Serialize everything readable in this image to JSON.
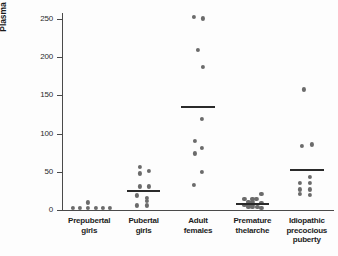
{
  "chart_data": {
    "type": "scatter",
    "title": "",
    "xlabel": "",
    "ylabel": "Plasma E2 (pg/mL)",
    "ylabel_parts": {
      "prefix": "Plasma E",
      "sub": "2",
      "suffix": " (pg/mL)"
    },
    "ylim": [
      0,
      258
    ],
    "yticks": [
      0,
      50,
      100,
      150,
      200,
      250
    ],
    "ytick_labels": [
      "0",
      "50",
      "100",
      "150",
      "200",
      "250"
    ],
    "grid": false,
    "legend": "none",
    "categories": [
      "Prepubertal girls",
      "Pubertal girls",
      "Adult females",
      "Premature thelarche",
      "Idiopathic precocious puberty"
    ],
    "category_label_lines": [
      [
        "Prepubertal",
        "girls"
      ],
      [
        "Pubertal",
        "girls"
      ],
      [
        "Adult",
        "females"
      ],
      [
        "Premature",
        "thelarche"
      ],
      [
        "Idiopathic",
        "precocious",
        "puberty"
      ]
    ],
    "series": [
      {
        "name": "Prepubertal girls",
        "mean": 3,
        "mean_line": false,
        "points": [
          {
            "value": 3,
            "offset": -16
          },
          {
            "value": 3,
            "offset": -9
          },
          {
            "value": 10,
            "offset": -1
          },
          {
            "value": 3,
            "offset": -1
          },
          {
            "value": 3,
            "offset": 7
          },
          {
            "value": 3,
            "offset": 14
          },
          {
            "value": 3,
            "offset": 21
          }
        ]
      },
      {
        "name": "Pubertal girls",
        "mean": 25,
        "mean_line": true,
        "points": [
          {
            "value": 56,
            "offset": -4
          },
          {
            "value": 48,
            "offset": -4
          },
          {
            "value": 51,
            "offset": 5
          },
          {
            "value": 31,
            "offset": -4
          },
          {
            "value": 31,
            "offset": 5
          },
          {
            "value": 19,
            "offset": -7
          },
          {
            "value": 16,
            "offset": 3
          },
          {
            "value": 12,
            "offset": 3
          },
          {
            "value": 6,
            "offset": -7
          },
          {
            "value": 6,
            "offset": 3
          }
        ]
      },
      {
        "name": "Adult females",
        "mean": 135,
        "mean_line": true,
        "points": [
          {
            "value": 253,
            "offset": -4
          },
          {
            "value": 251,
            "offset": 5
          },
          {
            "value": 210,
            "offset": 0
          },
          {
            "value": 187,
            "offset": 5
          },
          {
            "value": 119,
            "offset": 4
          },
          {
            "value": 90,
            "offset": -3
          },
          {
            "value": 81,
            "offset": 4
          },
          {
            "value": 74,
            "offset": -3
          },
          {
            "value": 50,
            "offset": 4
          },
          {
            "value": 33,
            "offset": -4
          }
        ]
      },
      {
        "name": "Premature thelarche",
        "mean": 8,
        "mean_line": true,
        "points": [
          {
            "value": 21,
            "offset": 9
          },
          {
            "value": 15,
            "offset": -8
          },
          {
            "value": 15,
            "offset": 0
          },
          {
            "value": 14,
            "offset": 4
          },
          {
            "value": 11,
            "offset": -4
          },
          {
            "value": 11,
            "offset": 0
          },
          {
            "value": 9,
            "offset": 9
          },
          {
            "value": 7,
            "offset": -8
          },
          {
            "value": 7,
            "offset": -4
          },
          {
            "value": 7,
            "offset": 0
          },
          {
            "value": 4,
            "offset": -4
          },
          {
            "value": 4,
            "offset": 0
          },
          {
            "value": 4,
            "offset": 5
          },
          {
            "value": 3,
            "offset": 9
          }
        ]
      },
      {
        "name": "Idiopathic precocious puberty",
        "mean": 53,
        "mean_line": true,
        "points": [
          {
            "value": 158,
            "offset": -3
          },
          {
            "value": 86,
            "offset": 5
          },
          {
            "value": 84,
            "offset": -5
          },
          {
            "value": 43,
            "offset": 3
          },
          {
            "value": 36,
            "offset": -7
          },
          {
            "value": 35,
            "offset": 3
          },
          {
            "value": 27,
            "offset": -7
          },
          {
            "value": 27,
            "offset": 3
          },
          {
            "value": 21,
            "offset": -7
          },
          {
            "value": 20,
            "offset": 3
          }
        ]
      }
    ],
    "colors": {
      "dot": "#6b6b6b",
      "mean_line": "#2a2a2a",
      "axis": "#4a4a4a",
      "text": "#1c1c1c",
      "background": "#fdfdfd"
    }
  }
}
